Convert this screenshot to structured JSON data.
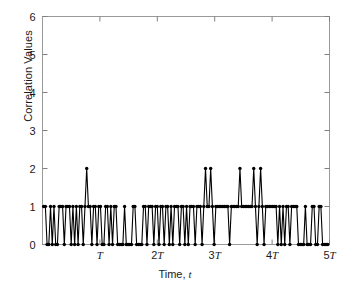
{
  "chart_data": {
    "type": "line",
    "title": "",
    "subtitle": "",
    "xlabel": "Time, t",
    "ylabel": "Correlation Values",
    "grid": false,
    "legend": null,
    "marker": "filled-circle",
    "line_color": "#000000",
    "axis_color": "#808080",
    "xlim": [
      0,
      5
    ],
    "ylim": [
      0,
      6
    ],
    "xtick_values": [
      1,
      2,
      3,
      4,
      5
    ],
    "xtick_labels": [
      "T",
      "2T",
      "3T",
      "4T",
      "5T"
    ],
    "xtick_unit": "T",
    "ytick_values": [
      0,
      1,
      2,
      3,
      4,
      5,
      6
    ],
    "ytick_labels": [
      "0",
      "1",
      "2",
      "3",
      "4",
      "5",
      "6"
    ],
    "x_unit_note": "x values are expressed in multiples of the period T",
    "series": [
      {
        "name": "correlation",
        "x": [
          0.02,
          0.05,
          0.08,
          0.11,
          0.14,
          0.17,
          0.2,
          0.23,
          0.26,
          0.29,
          0.32,
          0.35,
          0.38,
          0.41,
          0.44,
          0.47,
          0.5,
          0.53,
          0.56,
          0.59,
          0.62,
          0.65,
          0.68,
          0.71,
          0.74,
          0.77,
          0.8,
          0.83,
          0.86,
          0.89,
          0.92,
          0.95,
          0.98,
          1.01,
          1.04,
          1.07,
          1.1,
          1.13,
          1.16,
          1.19,
          1.22,
          1.25,
          1.28,
          1.31,
          1.34,
          1.37,
          1.4,
          1.43,
          1.46,
          1.49,
          1.52,
          1.55,
          1.58,
          1.61,
          1.64,
          1.67,
          1.7,
          1.73,
          1.76,
          1.79,
          1.82,
          1.85,
          1.88,
          1.91,
          1.94,
          1.97,
          2.0,
          2.03,
          2.06,
          2.09,
          2.12,
          2.15,
          2.18,
          2.21,
          2.24,
          2.27,
          2.3,
          2.33,
          2.36,
          2.39,
          2.42,
          2.45,
          2.48,
          2.51,
          2.54,
          2.57,
          2.6,
          2.63,
          2.66,
          2.69,
          2.72,
          2.75,
          2.78,
          2.81,
          2.84,
          2.87,
          2.9,
          2.93,
          2.96,
          2.99,
          3.02,
          3.05,
          3.08,
          3.11,
          3.14,
          3.17,
          3.2,
          3.23,
          3.26,
          3.29,
          3.32,
          3.35,
          3.38,
          3.41,
          3.44,
          3.47,
          3.5,
          3.53,
          3.56,
          3.59,
          3.62,
          3.65,
          3.68,
          3.71,
          3.74,
          3.77,
          3.8,
          3.83,
          3.86,
          3.89,
          3.92,
          3.95,
          3.98,
          4.01,
          4.04,
          4.07,
          4.1,
          4.13,
          4.16,
          4.19,
          4.22,
          4.25,
          4.28,
          4.31,
          4.34,
          4.37,
          4.4,
          4.43,
          4.46,
          4.49,
          4.52,
          4.55,
          4.58,
          4.61,
          4.64,
          4.67,
          4.7,
          4.73,
          4.76,
          4.79,
          4.82,
          4.85,
          4.88,
          4.91,
          4.94,
          4.97
        ],
        "y": [
          1,
          1,
          0,
          0,
          1,
          0,
          1,
          0,
          0,
          1,
          1,
          1,
          0,
          1,
          1,
          1,
          0,
          1,
          0,
          1,
          0,
          1,
          1,
          0,
          1,
          2,
          1,
          1,
          0,
          1,
          1,
          0,
          1,
          1,
          0,
          0,
          1,
          1,
          0,
          1,
          0,
          1,
          1,
          0,
          0,
          0,
          0,
          1,
          0,
          0,
          0,
          0,
          1,
          1,
          0,
          0,
          0,
          0,
          1,
          1,
          0,
          1,
          1,
          1,
          0,
          1,
          1,
          0,
          1,
          1,
          0,
          1,
          1,
          0,
          1,
          0,
          1,
          1,
          1,
          0,
          1,
          1,
          0,
          1,
          0,
          1,
          1,
          1,
          0,
          1,
          1,
          1,
          0,
          1,
          2,
          1,
          1,
          2,
          1,
          0,
          1,
          1,
          1,
          1,
          1,
          1,
          1,
          1,
          0,
          1,
          1,
          1,
          1,
          1,
          2,
          1,
          1,
          1,
          1,
          1,
          1,
          1,
          2,
          1,
          0,
          1,
          2,
          1,
          0,
          1,
          1,
          1,
          1,
          1,
          1,
          1,
          0,
          1,
          0,
          1,
          0,
          1,
          1,
          0,
          1,
          1,
          1,
          1,
          0,
          0,
          0,
          0,
          1,
          0,
          0,
          0,
          1,
          1,
          0,
          0,
          1,
          1,
          0,
          0,
          0,
          0
        ]
      }
    ],
    "peaks": {
      "value": 2,
      "approx_x_positions": [
        0.77,
        2.84,
        2.96,
        3.44,
        3.68,
        3.8
      ],
      "count": 6
    },
    "baseline_values": [
      0,
      1
    ]
  }
}
